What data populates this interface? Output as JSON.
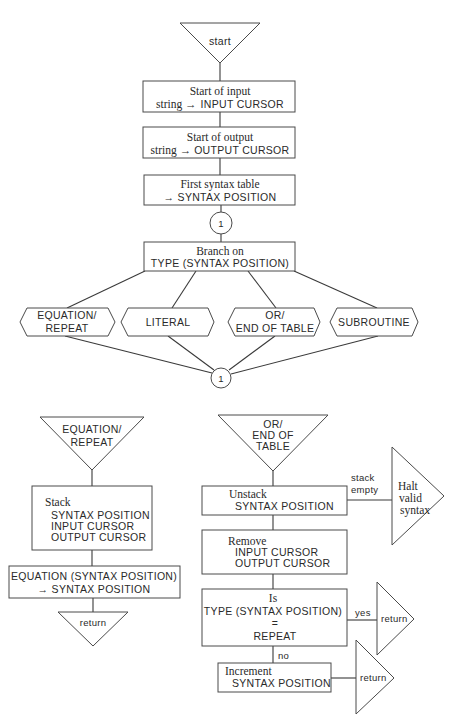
{
  "diagram": {
    "type": "flowchart",
    "main_flow": {
      "start": {
        "label": "start"
      },
      "step1": {
        "line1": "Start of input",
        "line2_prefix": "string →",
        "line2_main": "INPUT CURSOR"
      },
      "step2": {
        "line1": "Start of output",
        "line2_prefix": "string →",
        "line2_main": "OUTPUT CURSOR"
      },
      "step3": {
        "line1": "First syntax table",
        "line2": "→ SYNTAX POSITION"
      },
      "connector_top": {
        "label": "1"
      },
      "branch": {
        "line1": "Branch on",
        "line2": "TYPE (SYNTAX POSITION)"
      },
      "cases": [
        {
          "line1": "EQUATION/",
          "line2": "REPEAT"
        },
        {
          "line1": "LITERAL"
        },
        {
          "line1": "OR/",
          "line2": "END OF TABLE"
        },
        {
          "line1": "SUBROUTINE"
        }
      ],
      "connector_bottom": {
        "label": "1"
      }
    },
    "equation_repeat_flow": {
      "entry": {
        "line1": "EQUATION/",
        "line2": "REPEAT"
      },
      "stack": {
        "title": "Stack",
        "items": [
          "SYNTAX POSITION",
          "INPUT CURSOR",
          "OUTPUT CURSOR"
        ]
      },
      "assign": {
        "line1": "EQUATION (SYNTAX POSITION)",
        "line2": "→ SYNTAX POSITION"
      },
      "exit": {
        "label": "return"
      }
    },
    "or_end_flow": {
      "entry": {
        "line1": "OR/",
        "line2": "END OF",
        "line3": "TABLE"
      },
      "unstack": {
        "title": "Unstack",
        "item": "SYNTAX POSITION"
      },
      "stack_empty": {
        "line1": "stack",
        "line2": "empty"
      },
      "halt": {
        "line1": "Halt",
        "line2": "valid",
        "line3": "syntax"
      },
      "remove": {
        "title": "Remove",
        "items": [
          "INPUT CURSOR",
          "OUTPUT CURSOR"
        ]
      },
      "decision": {
        "line1": "Is",
        "line2": "TYPE (SYNTAX POSITION)",
        "line3": "=",
        "line4": "REPEAT"
      },
      "yes_label": "yes",
      "no_label": "no",
      "yes_exit": {
        "label": "return"
      },
      "increment": {
        "title": "Increment",
        "item": "SYNTAX POSITION"
      },
      "increment_exit": {
        "label": "return"
      }
    }
  }
}
